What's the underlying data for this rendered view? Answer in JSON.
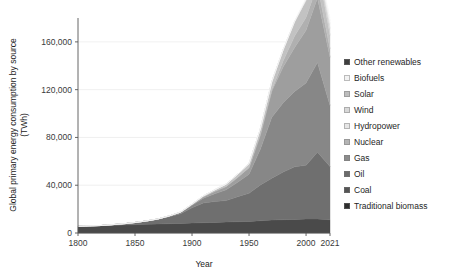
{
  "chart_data": {
    "type": "area",
    "title": "",
    "xlabel": "Year",
    "ylabel": "Global primary energy consumption by source (TWh)",
    "ylabel_line1": "Global primary energy consumption by source",
    "ylabel_line2": "(TWh)",
    "xlim": [
      1800,
      2021
    ],
    "ylim": [
      0,
      180000
    ],
    "grid": true,
    "stacked": true,
    "legend_position": "right",
    "x_ticks": [
      1800,
      1850,
      1900,
      1950,
      2000,
      2021
    ],
    "x_tick_labels": [
      "1800",
      "1850",
      "1900",
      "1950",
      "2000",
      "2021"
    ],
    "y_ticks": [
      0,
      40000,
      80000,
      120000,
      160000
    ],
    "y_tick_labels": [
      "0",
      "40,000",
      "80,000",
      "120,000",
      "160,000"
    ],
    "x": [
      1800,
      1810,
      1820,
      1830,
      1840,
      1850,
      1860,
      1870,
      1880,
      1890,
      1900,
      1910,
      1920,
      1930,
      1940,
      1950,
      1960,
      1970,
      1980,
      1990,
      2000,
      2010,
      2021
    ],
    "series": [
      {
        "name": "Traditional biomass",
        "color": "#4a4a4a",
        "values": [
          5556,
          5833,
          6111,
          6389,
          6667,
          6944,
          7222,
          7500,
          7778,
          8056,
          8333,
          8611,
          8889,
          9167,
          9444,
          9722,
          10278,
          10833,
          11111,
          11389,
          11667,
          11667,
          11111
        ]
      },
      {
        "name": "Coal",
        "color": "#6f6f6f",
        "values": [
          97,
          128,
          151,
          580,
          1061,
          1840,
          2800,
          4000,
          5900,
          8100,
          12800,
          16500,
          17500,
          18000,
          21000,
          23500,
          30000,
          35000,
          40000,
          44000,
          45000,
          56000,
          44473
        ]
      },
      {
        "name": "Oil",
        "color": "#878787",
        "values": [
          0,
          0,
          0,
          0,
          0,
          0,
          50,
          200,
          500,
          1000,
          2000,
          4000,
          6500,
          9000,
          12000,
          16000,
          30000,
          51000,
          58000,
          63000,
          69000,
          75000,
          51170
        ]
      },
      {
        "name": "Gas",
        "color": "#9e9e9e",
        "values": [
          0,
          0,
          0,
          0,
          0,
          0,
          0,
          30,
          80,
          200,
          600,
          1200,
          2000,
          2800,
          4000,
          5500,
          12000,
          22000,
          30000,
          37000,
          44000,
          54000,
          40375
        ]
      },
      {
        "name": "Nuclear",
        "color": "#b0b0b0",
        "values": [
          0,
          0,
          0,
          0,
          0,
          0,
          0,
          0,
          0,
          0,
          0,
          0,
          0,
          0,
          0,
          0,
          200,
          1000,
          5000,
          9500,
          10800,
          10900,
          7031
        ]
      },
      {
        "name": "Hydropower",
        "color": "#c2c2c2",
        "values": [
          0,
          0,
          0,
          0,
          0,
          0,
          0,
          0,
          50,
          150,
          400,
          800,
          1300,
          2000,
          2700,
          3400,
          5000,
          7000,
          9500,
          12000,
          14000,
          16500,
          11318
        ]
      },
      {
        "name": "Wind",
        "color": "#d2d2d2",
        "values": [
          0,
          0,
          0,
          0,
          0,
          0,
          0,
          0,
          0,
          0,
          0,
          0,
          0,
          0,
          0,
          0,
          0,
          0,
          0,
          100,
          800,
          3000,
          5613
        ]
      },
      {
        "name": "Solar",
        "color": "#e0e0e0",
        "values": [
          0,
          0,
          0,
          0,
          0,
          0,
          0,
          0,
          0,
          0,
          0,
          0,
          0,
          0,
          0,
          0,
          0,
          0,
          0,
          10,
          30,
          900,
          4009
        ]
      },
      {
        "name": "Biofuels",
        "color": "#efefef",
        "values": [
          0,
          0,
          0,
          0,
          0,
          0,
          0,
          0,
          0,
          0,
          0,
          0,
          0,
          0,
          0,
          0,
          0,
          0,
          50,
          200,
          700,
          2100,
          2625
        ]
      },
      {
        "name": "Other renewables",
        "color": "#f7f7f7",
        "values": [
          0,
          0,
          0,
          0,
          0,
          0,
          0,
          0,
          0,
          0,
          0,
          0,
          0,
          0,
          0,
          0,
          0,
          50,
          200,
          600,
          1200,
          2200,
          2207
        ]
      }
    ]
  },
  "legend": {
    "items": [
      {
        "label": "Other renewables",
        "color": "#3e3e3e"
      },
      {
        "label": "Biofuels",
        "color": "#f2f2f2"
      },
      {
        "label": "Solar",
        "color": "#bdbdbd"
      },
      {
        "label": "Wind",
        "color": "#d8d8d8"
      },
      {
        "label": "Hydropower",
        "color": "#e6e6e6"
      },
      {
        "label": "Nuclear",
        "color": "#b4b4b4"
      },
      {
        "label": "Gas",
        "color": "#8c8c8c"
      },
      {
        "label": "Oil",
        "color": "#6b6b6b"
      },
      {
        "label": "Coal",
        "color": "#545454"
      },
      {
        "label": "Traditional biomass",
        "color": "#2e2e2e"
      }
    ]
  },
  "axes": {
    "x_title": "Year",
    "y_title_line1": "Global primary energy consumption by source",
    "y_title_line2": "(TWh)"
  }
}
